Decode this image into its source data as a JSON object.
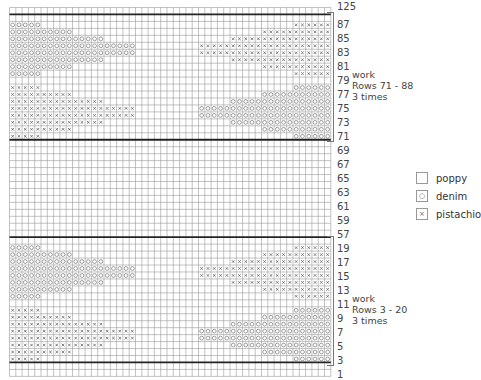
{
  "chart_data": {
    "type": "table",
    "columns": 51,
    "row_labels_visible": [
      "125",
      "87",
      "85",
      "83",
      "81",
      "79",
      "77",
      "75",
      "73",
      "71",
      "69",
      "67",
      "65",
      "63",
      "61",
      "59",
      "57",
      "19",
      "17",
      "15",
      "13",
      "11",
      "9",
      "7",
      "5",
      "3",
      "1"
    ],
    "sections": [
      {
        "rows": [
          "125"
        ],
        "pattern": "plain"
      },
      {
        "rows_from": 88,
        "rows_to": 71,
        "pattern": "motif"
      },
      {
        "rows_from": 70,
        "rows_to": 57,
        "pattern": "plain"
      },
      {
        "rows_from": 20,
        "rows_to": 3,
        "pattern": "motif"
      },
      {
        "rows_from": 2,
        "rows_to": 1,
        "pattern": "plain"
      }
    ],
    "motif": {
      "description": "18 rows; top half denim left / pistachio right, bottom half pistachio left / denim right",
      "left_counts": [
        0,
        5,
        10,
        15,
        20,
        20,
        15,
        10,
        5,
        0,
        5,
        10,
        15,
        20,
        20,
        15,
        10,
        5
      ],
      "right_counts": [
        0,
        6,
        11,
        16,
        21,
        21,
        16,
        11,
        6,
        0,
        6,
        11,
        16,
        21,
        21,
        16,
        11,
        6
      ],
      "left_colors": [
        "",
        "denim",
        "denim",
        "denim",
        "denim",
        "denim",
        "denim",
        "denim",
        "denim",
        "",
        "pistachio",
        "pistachio",
        "pistachio",
        "pistachio",
        "pistachio",
        "pistachio",
        "pistachio",
        "pistachio"
      ],
      "right_colors": [
        "",
        "pistachio",
        "pistachio",
        "pistachio",
        "pistachio",
        "pistachio",
        "pistachio",
        "pistachio",
        "pistachio",
        "",
        "denim",
        "denim",
        "denim",
        "denim",
        "denim",
        "denim",
        "denim",
        "denim"
      ]
    },
    "legend": [
      {
        "symbol": "blank",
        "label": "poppy"
      },
      {
        "symbol": "circle",
        "label": "denim"
      },
      {
        "symbol": "x",
        "label": "pistachio"
      }
    ]
  },
  "annotations": {
    "upper": {
      "line1": "work",
      "line2": "Rows 71 - 88",
      "line3": "3 times"
    },
    "lower": {
      "line1": "work",
      "line2": "Rows 3 - 20",
      "line3": "3 times"
    }
  },
  "legend": {
    "poppy": {
      "symbol": "",
      "label": "poppy"
    },
    "denim": {
      "symbol": "○",
      "label": "denim"
    },
    "pistachio": {
      "symbol": "×",
      "label": "pistachio"
    }
  },
  "row_labels": [
    {
      "text": "125",
      "y": 2
    },
    {
      "text": "87",
      "y": 20
    },
    {
      "text": "85",
      "y": 34
    },
    {
      "text": "83",
      "y": 48
    },
    {
      "text": "81",
      "y": 62
    },
    {
      "text": "79",
      "y": 76
    },
    {
      "text": "77",
      "y": 90
    },
    {
      "text": "75",
      "y": 104
    },
    {
      "text": "73",
      "y": 118
    },
    {
      "text": "71",
      "y": 132
    },
    {
      "text": "69",
      "y": 146
    },
    {
      "text": "67",
      "y": 160
    },
    {
      "text": "65",
      "y": 174
    },
    {
      "text": "63",
      "y": 188
    },
    {
      "text": "61",
      "y": 202
    },
    {
      "text": "59",
      "y": 216
    },
    {
      "text": "57",
      "y": 230
    },
    {
      "text": "19",
      "y": 244
    },
    {
      "text": "17",
      "y": 258
    },
    {
      "text": "15",
      "y": 272
    },
    {
      "text": "13",
      "y": 286
    },
    {
      "text": "11",
      "y": 300
    },
    {
      "text": "9",
      "y": 314
    },
    {
      "text": "7",
      "y": 328
    },
    {
      "text": "5",
      "y": 342
    },
    {
      "text": "3",
      "y": 356
    },
    {
      "text": "1",
      "y": 370
    }
  ]
}
